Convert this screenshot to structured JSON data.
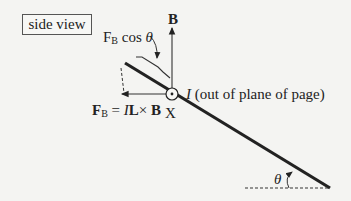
{
  "title_box": {
    "label": "side view"
  },
  "labels": {
    "B_field": "B",
    "fb_cos_theta": {
      "base": "F",
      "sub": "B",
      "rest": " cos ",
      "theta": "θ"
    },
    "force_eq": {
      "F": "F",
      "sub": "B",
      "eq": " = ",
      "I": "I",
      "L": "L",
      "times": "× ",
      "B": "B"
    },
    "current": {
      "I": "I",
      "rest": " (out of plane of page)"
    },
    "axis_point": "X",
    "angle": "θ"
  },
  "colors": {
    "line": "#222222",
    "background": "#f4f4f2"
  }
}
